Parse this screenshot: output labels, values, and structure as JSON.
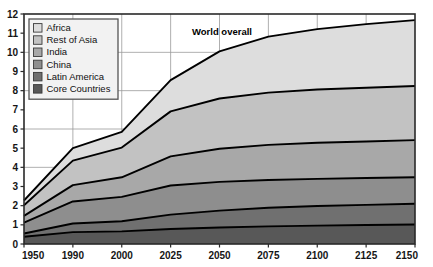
{
  "chart_data": {
    "type": "area",
    "stacked": true,
    "title": "",
    "subtitle": "",
    "xlabel": "",
    "ylabel": "",
    "annotation": "World overall",
    "categories": [
      "1950",
      "1990",
      "2000",
      "2025",
      "2050",
      "2075",
      "2100",
      "2125",
      "2150"
    ],
    "x": [
      1950,
      1990,
      2000,
      2025,
      2050,
      2075,
      2100,
      2125,
      2150
    ],
    "xlim": [
      0,
      8
    ],
    "ylim": [
      0,
      12
    ],
    "yticks": [
      0,
      1,
      2,
      3,
      4,
      5,
      6,
      7,
      8,
      9,
      10,
      11,
      12
    ],
    "ytick_labels": [
      "0",
      "1",
      "2",
      "3",
      "4",
      "5",
      "6",
      "7",
      "8",
      "9",
      "10",
      "11",
      "12"
    ],
    "grid": true,
    "grid_y_values": [
      2,
      4,
      6,
      8,
      10,
      12
    ],
    "legend_position": "top-left",
    "units_note": "",
    "series": [
      {
        "name": "Core Countries",
        "color": "#585858",
        "values": [
          0.38,
          0.62,
          0.66,
          0.78,
          0.86,
          0.92,
          0.96,
          0.99,
          1.02
        ]
      },
      {
        "name": "Latin America",
        "color": "#707070",
        "values": [
          0.17,
          0.45,
          0.53,
          0.75,
          0.88,
          0.97,
          1.02,
          1.05,
          1.08
        ]
      },
      {
        "name": "China",
        "color": "#8e8e8e",
        "values": [
          0.56,
          1.15,
          1.27,
          1.52,
          1.5,
          1.45,
          1.42,
          1.4,
          1.38
        ]
      },
      {
        "name": "India",
        "color": "#a8a8a8",
        "values": [
          0.36,
          0.85,
          1.02,
          1.52,
          1.73,
          1.83,
          1.88,
          1.91,
          1.94
        ]
      },
      {
        "name": "Rest of Asia",
        "color": "#c2c2c2",
        "values": [
          0.55,
          1.28,
          1.55,
          2.35,
          2.62,
          2.73,
          2.78,
          2.8,
          2.82
        ]
      },
      {
        "name": "Africa",
        "color": "#dddddd",
        "values": [
          0.25,
          0.65,
          0.82,
          1.63,
          2.46,
          2.92,
          3.15,
          3.32,
          3.44
        ]
      }
    ],
    "totals": [
      2.27,
      5.0,
      5.85,
      8.55,
      10.05,
      10.82,
      11.21,
      11.47,
      11.68
    ]
  },
  "legend": {
    "items": [
      {
        "label": "Africa",
        "color": "#dddddd"
      },
      {
        "label": "Rest of Asia",
        "color": "#c2c2c2"
      },
      {
        "label": "India",
        "color": "#a8a8a8"
      },
      {
        "label": "China",
        "color": "#8e8e8e"
      },
      {
        "label": "Latin America",
        "color": "#707070"
      },
      {
        "label": "Core Countries",
        "color": "#585858"
      }
    ]
  },
  "colors": {
    "axis": "#2a2a2a",
    "grid": "#9a9a9a",
    "curve": "#000000",
    "background": "#ffffff",
    "legend_border": "#555555",
    "legend_background": "#f2f2f2"
  }
}
